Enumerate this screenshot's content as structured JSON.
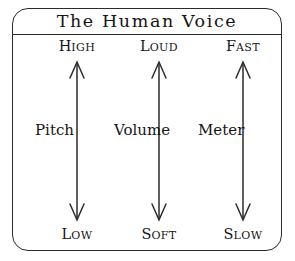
{
  "title": "The Human Voice",
  "diagram": {
    "type": "triple-bidirectional-axis",
    "frame_shape": "rounded-rectangle",
    "stroke_color": "#2b2b2b",
    "background_color": "#ffffff",
    "text_color": "#151515",
    "columns": [
      {
        "name": "pitch",
        "top_label": "High",
        "top_label_initial": "H",
        "top_label_rest": "IGH",
        "middle_label": "Pitch",
        "bottom_label": "Low",
        "bottom_label_initial": "L",
        "bottom_label_rest": "OW",
        "arrow": "double-headed-vertical"
      },
      {
        "name": "volume",
        "top_label": "Loud",
        "top_label_initial": "L",
        "top_label_rest": "OUD",
        "middle_label": "Volume",
        "bottom_label": "Soft",
        "bottom_label_initial": "S",
        "bottom_label_rest": "OFT",
        "arrow": "double-headed-vertical"
      },
      {
        "name": "meter",
        "top_label": "Fast",
        "top_label_initial": "F",
        "top_label_rest": "AST",
        "middle_label": "Meter",
        "bottom_label": "Slow",
        "bottom_label_initial": "S",
        "bottom_label_rest": "LOW",
        "arrow": "double-headed-vertical"
      }
    ]
  }
}
